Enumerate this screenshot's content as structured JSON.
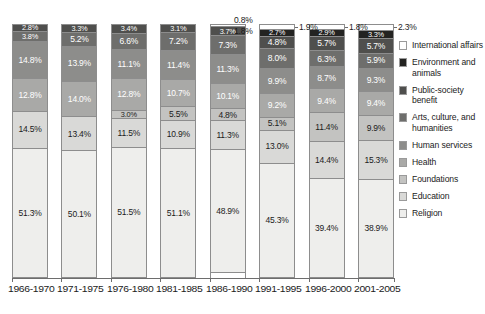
{
  "chart_data": {
    "type": "bar",
    "subtype": "stacked-bar-100",
    "title": "",
    "xlabel": "",
    "ylabel": "",
    "ylim": [
      0,
      100
    ],
    "grid": false,
    "legend_position": "right",
    "categories": [
      "1966-1970",
      "1971-1975",
      "1976-1980",
      "1981-1985",
      "1986-1990",
      "1991-1995",
      "1996-2000",
      "2001-2005"
    ],
    "series": [
      {
        "name": "Religion",
        "color": "#eeeeec",
        "text": "dark",
        "values": [
          51.3,
          50.1,
          51.5,
          51.1,
          48.9,
          45.3,
          39.4,
          38.9
        ]
      },
      {
        "name": "Education",
        "color": "#d9d9d7",
        "text": "dark",
        "values": [
          14.5,
          13.4,
          11.5,
          10.9,
          11.3,
          13.0,
          14.4,
          15.3
        ]
      },
      {
        "name": "Foundations",
        "color": "#c3c3c1",
        "text": "dark",
        "values": [
          null,
          null,
          3.0,
          5.5,
          4.8,
          5.1,
          11.4,
          9.9
        ]
      },
      {
        "name": "Health",
        "color": "#a9a9a7",
        "text": "light",
        "values": [
          12.8,
          14.0,
          12.8,
          10.7,
          10.1,
          9.2,
          9.4,
          9.4
        ]
      },
      {
        "name": "Human services",
        "color": "#8d8d8b",
        "text": "light",
        "values": [
          14.8,
          13.9,
          11.1,
          11.4,
          11.3,
          9.9,
          8.7,
          9.3
        ]
      },
      {
        "name": "Arts, culture, and humanities",
        "color": "#6e6e6c",
        "text": "light",
        "values": [
          3.8,
          5.2,
          6.6,
          7.2,
          7.3,
          8.0,
          6.3,
          5.9
        ]
      },
      {
        "name": "Public-society benefit",
        "color": "#4f4f4d",
        "text": "light",
        "values": [
          2.8,
          3.3,
          3.4,
          3.1,
          3.7,
          4.8,
          5.7,
          5.7
        ]
      },
      {
        "name": "Environment and animals",
        "color": "#232321",
        "text": "light",
        "values": [
          null,
          null,
          null,
          null,
          null,
          2.7,
          2.9,
          3.3
        ]
      },
      {
        "name": "International affairs",
        "color": "#ffffff",
        "text": "dark",
        "values": [
          null,
          null,
          null,
          null,
          0.8,
          1.9,
          1.8,
          2.3
        ]
      }
    ],
    "callouts": [
      {
        "category": "1986-1990",
        "series": "International affairs",
        "value": "0.8%"
      },
      {
        "category": "1986-1990",
        "series": "Environment and animals",
        "value": "1.8%"
      },
      {
        "category": "1991-1995",
        "series": "International affairs",
        "value": "1.9%"
      },
      {
        "category": "1996-2000",
        "series": "International affairs",
        "value": "1.8%"
      },
      {
        "category": "2001-2005",
        "series": "International affairs",
        "value": "2.3%"
      }
    ]
  },
  "legend": {
    "items": [
      {
        "label": "International affairs",
        "color": "#ffffff"
      },
      {
        "label": "Environment and animals",
        "color": "#232321"
      },
      {
        "label": "Public-society benefit",
        "color": "#4f4f4d"
      },
      {
        "label": "Arts, culture, and humanities",
        "color": "#6e6e6c"
      },
      {
        "label": "Human services",
        "color": "#8d8d8b"
      },
      {
        "label": "Health",
        "color": "#a9a9a7"
      },
      {
        "label": "Foundations",
        "color": "#c3c3c1"
      },
      {
        "label": "Education",
        "color": "#d9d9d7"
      },
      {
        "label": "Religion",
        "color": "#eeeeec"
      }
    ]
  },
  "bar_labels": {
    "1966-1970": [
      "51.3%",
      "14.5%",
      null,
      "12.8%",
      "14.8%",
      "3.8%",
      "2.8%",
      null,
      null
    ],
    "1971-1975": [
      "50.1%",
      "13.4%",
      null,
      "14.0%",
      "13.9%",
      "5.2%",
      "3.3%",
      null,
      null
    ],
    "1976-1980": [
      "51.5%",
      "11.5%",
      "3.0%",
      "12.8%",
      "11.1%",
      "6.6%",
      "3.4%",
      null,
      null
    ],
    "1981-1985": [
      "51.1%",
      "10.9%",
      "5.5%",
      "10.7%",
      "11.4%",
      "7.2%",
      "3.1%",
      null,
      null
    ],
    "1986-1990": [
      "48.9%",
      "11.3%",
      "4.8%",
      "10.1%",
      "11.3%",
      "7.3%",
      "3.7%",
      null,
      null
    ],
    "1991-1995": [
      "45.3%",
      "13.0%",
      "5.1%",
      "9.2%",
      "9.9%",
      "8.0%",
      "4.8%",
      "2.7%",
      null
    ],
    "1996-2000": [
      "39.4%",
      "14.4%",
      "11.4%",
      "9.4%",
      "8.7%",
      "6.3%",
      "5.7%",
      "2.9%",
      null
    ],
    "2001-2005": [
      "38.9%",
      "15.3%",
      "9.9%",
      "9.4%",
      "9.3%",
      "5.9%",
      "5.7%",
      "3.3%",
      null
    ]
  }
}
